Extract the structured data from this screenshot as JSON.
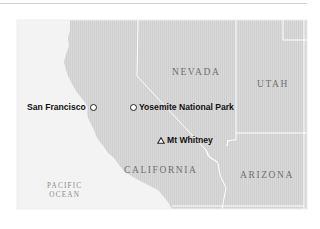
{
  "map": {
    "colors": {
      "land": "#d6d6d6",
      "land_outside": "#f2f2f2",
      "ocean": "#f4f4f4",
      "border": "#ffffff",
      "state_label": "#6f6f6f",
      "poi_label": "#111111"
    },
    "states": [
      {
        "name": "NEVADA"
      },
      {
        "name": "UTAH"
      },
      {
        "name": "CALIFORNIA"
      },
      {
        "name": "ARIZONA"
      }
    ],
    "ocean": {
      "line1": "PACIFIC",
      "line2": "OCEAN"
    },
    "points_of_interest": [
      {
        "name": "San Francisco",
        "marker": "circle-marker"
      },
      {
        "name": "Yosemite National Park",
        "marker": "circle-marker"
      },
      {
        "name": "Mt Whitney",
        "marker": "triangle-marker"
      }
    ]
  }
}
